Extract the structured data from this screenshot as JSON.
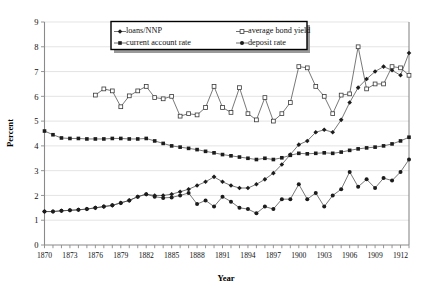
{
  "chart_data": {
    "type": "line",
    "title": "",
    "xlabel": "Year",
    "ylabel": "Percent",
    "ylim": [
      0,
      9
    ],
    "yticks": [
      0,
      1,
      2,
      3,
      4,
      5,
      6,
      7,
      8,
      9
    ],
    "xlim": [
      1870,
      1913
    ],
    "xticks": [
      1870,
      1873,
      1876,
      1879,
      1882,
      1885,
      1888,
      1891,
      1894,
      1897,
      1900,
      1903,
      1906,
      1909,
      1912
    ],
    "grid": "horizontal",
    "legend_position": "top-center",
    "x": [
      1870,
      1871,
      1872,
      1873,
      1874,
      1875,
      1876,
      1877,
      1878,
      1879,
      1880,
      1881,
      1882,
      1883,
      1884,
      1885,
      1886,
      1887,
      1888,
      1889,
      1890,
      1891,
      1892,
      1893,
      1894,
      1895,
      1896,
      1897,
      1898,
      1899,
      1900,
      1901,
      1902,
      1903,
      1904,
      1905,
      1906,
      1907,
      1908,
      1909,
      1910,
      1911,
      1912,
      1913
    ],
    "series": [
      {
        "name": "loans/NNP",
        "marker": "filled-diamond",
        "x": [
          1870,
          1871,
          1872,
          1873,
          1874,
          1875,
          1876,
          1877,
          1878,
          1879,
          1880,
          1881,
          1882,
          1883,
          1884,
          1885,
          1886,
          1887,
          1888,
          1889,
          1890,
          1891,
          1892,
          1893,
          1894,
          1895,
          1896,
          1897,
          1898,
          1899,
          1900,
          1901,
          1902,
          1903,
          1904,
          1905,
          1906,
          1907,
          1908,
          1909,
          1910,
          1911,
          1912,
          1913
        ],
        "values": [
          1.35,
          1.35,
          1.38,
          1.4,
          1.42,
          1.45,
          1.5,
          1.55,
          1.6,
          1.7,
          1.8,
          1.95,
          2.05,
          2.0,
          2.0,
          2.05,
          2.15,
          2.25,
          2.4,
          2.55,
          2.75,
          2.55,
          2.4,
          2.3,
          2.3,
          2.45,
          2.65,
          2.9,
          3.25,
          3.65,
          4.05,
          4.2,
          4.55,
          4.65,
          4.55,
          5.05,
          5.75,
          6.35,
          6.7,
          7.0,
          7.2,
          7.05,
          6.85,
          7.75
        ]
      },
      {
        "name": "average bond yield",
        "marker": "open-square",
        "x": [
          1876,
          1877,
          1878,
          1879,
          1880,
          1881,
          1882,
          1883,
          1884,
          1885,
          1886,
          1887,
          1888,
          1889,
          1890,
          1891,
          1892,
          1893,
          1894,
          1895,
          1896,
          1897,
          1898,
          1899,
          1900,
          1901,
          1902,
          1903,
          1904,
          1905,
          1906,
          1907,
          1908,
          1909,
          1910,
          1911,
          1912,
          1913
        ],
        "values": [
          6.05,
          6.3,
          6.22,
          5.58,
          6.02,
          6.22,
          6.4,
          5.95,
          5.9,
          6.0,
          5.2,
          5.3,
          5.25,
          5.55,
          6.4,
          5.55,
          5.35,
          6.35,
          5.3,
          5.05,
          5.95,
          5.0,
          5.3,
          5.75,
          7.2,
          7.15,
          6.4,
          6.0,
          5.3,
          6.05,
          6.1,
          8.0,
          6.3,
          6.5,
          6.5,
          7.2,
          7.15,
          6.85
        ]
      },
      {
        "name": "current account rate",
        "marker": "filled-square",
        "x": [
          1870,
          1871,
          1872,
          1873,
          1874,
          1875,
          1876,
          1877,
          1878,
          1879,
          1880,
          1881,
          1882,
          1883,
          1884,
          1885,
          1886,
          1887,
          1888,
          1889,
          1890,
          1891,
          1892,
          1893,
          1894,
          1895,
          1896,
          1897,
          1898,
          1899,
          1900,
          1901,
          1902,
          1903,
          1904,
          1905,
          1906,
          1907,
          1908,
          1909,
          1910,
          1911,
          1912,
          1913
        ],
        "values": [
          4.6,
          4.45,
          4.32,
          4.3,
          4.3,
          4.28,
          4.28,
          4.28,
          4.3,
          4.3,
          4.28,
          4.28,
          4.3,
          4.2,
          4.1,
          4.0,
          3.95,
          3.9,
          3.85,
          3.78,
          3.72,
          3.65,
          3.6,
          3.55,
          3.5,
          3.45,
          3.5,
          3.45,
          3.52,
          3.62,
          3.7,
          3.68,
          3.7,
          3.72,
          3.7,
          3.75,
          3.82,
          3.88,
          3.92,
          3.95,
          4.0,
          4.08,
          4.2,
          4.35
        ]
      },
      {
        "name": "deposit rate",
        "marker": "filled-circle",
        "x": [
          1870,
          1871,
          1872,
          1873,
          1874,
          1875,
          1876,
          1877,
          1878,
          1879,
          1880,
          1881,
          1882,
          1883,
          1884,
          1885,
          1886,
          1887,
          1888,
          1889,
          1890,
          1891,
          1892,
          1893,
          1894,
          1895,
          1896,
          1897,
          1898,
          1899,
          1900,
          1901,
          1902,
          1903,
          1904,
          1905,
          1906,
          1907,
          1908,
          1909,
          1910,
          1911,
          1912,
          1913
        ],
        "values": [
          1.35,
          1.35,
          1.38,
          1.4,
          1.42,
          1.45,
          1.5,
          1.55,
          1.6,
          1.7,
          1.8,
          1.95,
          2.05,
          1.95,
          1.9,
          1.92,
          2.0,
          2.1,
          1.65,
          1.8,
          1.55,
          1.95,
          1.75,
          1.5,
          1.45,
          1.28,
          1.55,
          1.45,
          1.85,
          1.85,
          2.45,
          1.85,
          2.1,
          1.55,
          2.0,
          2.25,
          2.95,
          2.35,
          2.65,
          2.3,
          2.7,
          2.6,
          2.95,
          3.45
        ]
      }
    ]
  },
  "legend": {
    "entries": [
      {
        "label": "loans/NNP"
      },
      {
        "label": "average bond yield"
      },
      {
        "label": "current account rate"
      },
      {
        "label": "deposit rate"
      }
    ]
  },
  "colors": {
    "line": "#4b4b4b",
    "axis": "#8a8a8a",
    "grid": "#d9d9d9",
    "text": "#111111"
  }
}
